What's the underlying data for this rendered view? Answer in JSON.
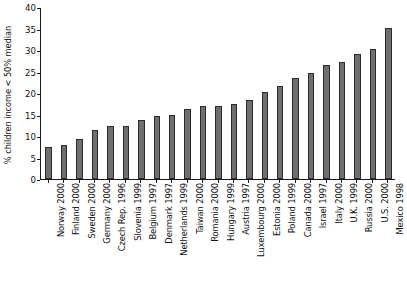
{
  "chart_data": {
    "type": "bar",
    "title": "",
    "xlabel": "",
    "ylabel": "% children income < 50% median",
    "ylim": [
      0,
      40
    ],
    "yticks": [
      0,
      5,
      10,
      15,
      20,
      25,
      30,
      35,
      40
    ],
    "ytick_labels": [
      "0",
      "5",
      "10",
      "15",
      "20",
      "25",
      "30",
      "35",
      "40"
    ],
    "grid": false,
    "legend": "none",
    "bar_color": "#706f6f",
    "bar_edge_color": "#2b2b2b",
    "axis_color": "#1a1a1a",
    "categories": [
      "Norway 2000",
      "Finland 2000",
      "Sweden 2000",
      "Germany 2000",
      "Czech Rep. 1996",
      "Slovenia 1999",
      "Belgium 1997",
      "Denmark 1997",
      "Netherlands 1999",
      "Taiwan 2000",
      "Romania 2000",
      "Hungary 1999",
      "Austria 1997",
      "Luxembourg 2000",
      "Estonia 2000",
      "Poland 1999",
      "Canada 2000",
      "Israel 1997",
      "Italy 2000",
      "U.K. 1999",
      "Russia 2000",
      "U.S. 2000",
      "Mexico 1998"
    ],
    "values": [
      7.4,
      7.9,
      9.2,
      11.3,
      12.3,
      12.4,
      13.8,
      14.6,
      14.9,
      16.2,
      16.9,
      17.0,
      17.4,
      18.4,
      20.2,
      21.6,
      23.5,
      24.7,
      26.6,
      27.2,
      29.1,
      30.3,
      35.2
    ]
  }
}
